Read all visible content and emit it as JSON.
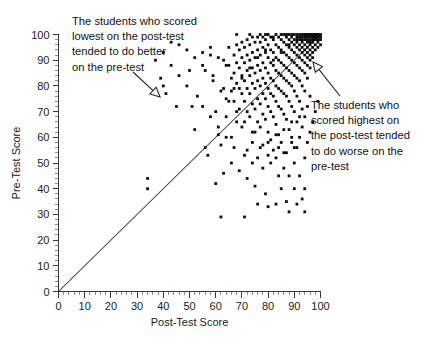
{
  "chart_data": {
    "type": "scatter",
    "title": "",
    "xlabel": "Post-Test Score",
    "ylabel": "Pre-Test Score",
    "xlim": [
      0,
      100
    ],
    "ylim": [
      0,
      100
    ],
    "xticks": [
      0,
      10,
      20,
      30,
      40,
      50,
      60,
      70,
      80,
      90,
      100
    ],
    "yticks": [
      0,
      10,
      20,
      30,
      40,
      50,
      60,
      70,
      80,
      90,
      100
    ],
    "minor_tick_step": 2,
    "grid": false,
    "legend": "none",
    "point_color": "#0d0d0d",
    "point_size_px": 2.1,
    "reference_line": {
      "name": "y = x identity line",
      "from": [
        0,
        0
      ],
      "to": [
        100,
        100
      ],
      "color": "#333333"
    },
    "annotations": [
      {
        "id": "low-post-test-note",
        "text_lines": [
          "The students who scored",
          "lowest on the post-test",
          "tended to do better",
          "on the pre-test"
        ],
        "text_anchor_px": [
          72,
          14
        ],
        "arrow_from_px": [
          133,
          72
        ],
        "arrow_to_px": [
          160,
          97
        ],
        "arrow_head": "hollow-triangle"
      },
      {
        "id": "high-post-test-note",
        "text_lines": [
          "The students who",
          "scored highest on",
          "the post-test tended",
          "to do worse on the",
          "pre-test"
        ],
        "text_anchor_px": [
          311,
          98
        ],
        "arrow_from_px": [
          340,
          96
        ],
        "arrow_to_px": [
          313,
          62
        ],
        "arrow_head": "hollow-triangle"
      }
    ],
    "points": [
      [
        34,
        44
      ],
      [
        34,
        40
      ],
      [
        62,
        29
      ],
      [
        71,
        29
      ],
      [
        39,
        83
      ],
      [
        40,
        80
      ],
      [
        41,
        77
      ],
      [
        45,
        72
      ],
      [
        50,
        86
      ],
      [
        51,
        72
      ],
      [
        55,
        88
      ],
      [
        52,
        63
      ],
      [
        56,
        56
      ],
      [
        58,
        92
      ],
      [
        59,
        84
      ],
      [
        60,
        70
      ],
      [
        57,
        53
      ],
      [
        61,
        61
      ],
      [
        62,
        57
      ],
      [
        63,
        90
      ],
      [
        63,
        79
      ],
      [
        64,
        75
      ],
      [
        64,
        68
      ],
      [
        65,
        95
      ],
      [
        65,
        88
      ],
      [
        66,
        83
      ],
      [
        66,
        78
      ],
      [
        66,
        60
      ],
      [
        67,
        92
      ],
      [
        67,
        85
      ],
      [
        67,
        74
      ],
      [
        68,
        96
      ],
      [
        68,
        89
      ],
      [
        68,
        81
      ],
      [
        68,
        66
      ],
      [
        69,
        94
      ],
      [
        69,
        87
      ],
      [
        69,
        79
      ],
      [
        69,
        71
      ],
      [
        70,
        97
      ],
      [
        70,
        91
      ],
      [
        70,
        84
      ],
      [
        70,
        77
      ],
      [
        70,
        64
      ],
      [
        71,
        95
      ],
      [
        71,
        89
      ],
      [
        71,
        82
      ],
      [
        71,
        74
      ],
      [
        72,
        98
      ],
      [
        72,
        92
      ],
      [
        72,
        86
      ],
      [
        72,
        79
      ],
      [
        72,
        70
      ],
      [
        72,
        55
      ],
      [
        73,
        96
      ],
      [
        73,
        90
      ],
      [
        73,
        84
      ],
      [
        73,
        77
      ],
      [
        73,
        68
      ],
      [
        74,
        99
      ],
      [
        74,
        93
      ],
      [
        74,
        87
      ],
      [
        74,
        81
      ],
      [
        74,
        73
      ],
      [
        74,
        58
      ],
      [
        75,
        97
      ],
      [
        75,
        91
      ],
      [
        75,
        85
      ],
      [
        75,
        79
      ],
      [
        75,
        71
      ],
      [
        75,
        62
      ],
      [
        76,
        99
      ],
      [
        76,
        94
      ],
      [
        76,
        88
      ],
      [
        76,
        82
      ],
      [
        76,
        75
      ],
      [
        76,
        66
      ],
      [
        76,
        52
      ],
      [
        77,
        97
      ],
      [
        77,
        92
      ],
      [
        77,
        86
      ],
      [
        77,
        80
      ],
      [
        77,
        73
      ],
      [
        77,
        64
      ],
      [
        78,
        99
      ],
      [
        78,
        95
      ],
      [
        78,
        89
      ],
      [
        78,
        83
      ],
      [
        78,
        77
      ],
      [
        78,
        69
      ],
      [
        78,
        57
      ],
      [
        79,
        98
      ],
      [
        79,
        93
      ],
      [
        79,
        87
      ],
      [
        79,
        81
      ],
      [
        79,
        75
      ],
      [
        79,
        67
      ],
      [
        80,
        100
      ],
      [
        80,
        96
      ],
      [
        80,
        91
      ],
      [
        80,
        85
      ],
      [
        80,
        79
      ],
      [
        80,
        72
      ],
      [
        80,
        62
      ],
      [
        80,
        53
      ],
      [
        81,
        99
      ],
      [
        81,
        94
      ],
      [
        81,
        89
      ],
      [
        81,
        83
      ],
      [
        81,
        77
      ],
      [
        81,
        70
      ],
      [
        81,
        59
      ],
      [
        82,
        98
      ],
      [
        82,
        93
      ],
      [
        82,
        88
      ],
      [
        82,
        82
      ],
      [
        82,
        76
      ],
      [
        82,
        68
      ],
      [
        82,
        55
      ],
      [
        83,
        100
      ],
      [
        83,
        96
      ],
      [
        83,
        91
      ],
      [
        83,
        86
      ],
      [
        83,
        80
      ],
      [
        83,
        74
      ],
      [
        83,
        65
      ],
      [
        84,
        99
      ],
      [
        84,
        95
      ],
      [
        84,
        90
      ],
      [
        84,
        85
      ],
      [
        84,
        79
      ],
      [
        84,
        72
      ],
      [
        84,
        61
      ],
      [
        85,
        98
      ],
      [
        85,
        94
      ],
      [
        85,
        89
      ],
      [
        85,
        84
      ],
      [
        85,
        78
      ],
      [
        85,
        71
      ],
      [
        85,
        58
      ],
      [
        86,
        100
      ],
      [
        86,
        97
      ],
      [
        86,
        93
      ],
      [
        86,
        88
      ],
      [
        86,
        83
      ],
      [
        86,
        77
      ],
      [
        86,
        69
      ],
      [
        86,
        54
      ],
      [
        87,
        99
      ],
      [
        87,
        96
      ],
      [
        87,
        92
      ],
      [
        87,
        87
      ],
      [
        87,
        82
      ],
      [
        87,
        76
      ],
      [
        87,
        67
      ],
      [
        88,
        100
      ],
      [
        88,
        98
      ],
      [
        88,
        95
      ],
      [
        88,
        91
      ],
      [
        88,
        86
      ],
      [
        88,
        81
      ],
      [
        88,
        74
      ],
      [
        88,
        63
      ],
      [
        89,
        99
      ],
      [
        89,
        97
      ],
      [
        89,
        94
      ],
      [
        89,
        90
      ],
      [
        89,
        85
      ],
      [
        89,
        80
      ],
      [
        89,
        72
      ],
      [
        89,
        60
      ],
      [
        90,
        100
      ],
      [
        90,
        98
      ],
      [
        90,
        96
      ],
      [
        90,
        93
      ],
      [
        90,
        89
      ],
      [
        90,
        84
      ],
      [
        90,
        78
      ],
      [
        90,
        70
      ],
      [
        90,
        56
      ],
      [
        91,
        100
      ],
      [
        91,
        99
      ],
      [
        91,
        97
      ],
      [
        91,
        95
      ],
      [
        91,
        92
      ],
      [
        91,
        88
      ],
      [
        91,
        83
      ],
      [
        91,
        76
      ],
      [
        91,
        66
      ],
      [
        92,
        100
      ],
      [
        92,
        99
      ],
      [
        92,
        98
      ],
      [
        92,
        96
      ],
      [
        92,
        94
      ],
      [
        92,
        91
      ],
      [
        92,
        87
      ],
      [
        92,
        82
      ],
      [
        92,
        74
      ],
      [
        93,
        100
      ],
      [
        93,
        99
      ],
      [
        93,
        98
      ],
      [
        93,
        97
      ],
      [
        93,
        95
      ],
      [
        93,
        93
      ],
      [
        93,
        90
      ],
      [
        93,
        86
      ],
      [
        93,
        80
      ],
      [
        93,
        71
      ],
      [
        94,
        100
      ],
      [
        94,
        100
      ],
      [
        94,
        99
      ],
      [
        94,
        98
      ],
      [
        94,
        96
      ],
      [
        94,
        94
      ],
      [
        94,
        92
      ],
      [
        94,
        89
      ],
      [
        94,
        85
      ],
      [
        94,
        78
      ],
      [
        95,
        100
      ],
      [
        95,
        100
      ],
      [
        95,
        99
      ],
      [
        95,
        98
      ],
      [
        95,
        97
      ],
      [
        95,
        95
      ],
      [
        95,
        93
      ],
      [
        95,
        91
      ],
      [
        95,
        88
      ],
      [
        95,
        83
      ],
      [
        96,
        100
      ],
      [
        96,
        100
      ],
      [
        96,
        99
      ],
      [
        96,
        98
      ],
      [
        96,
        97
      ],
      [
        96,
        96
      ],
      [
        96,
        94
      ],
      [
        96,
        92
      ],
      [
        96,
        90
      ],
      [
        96,
        87
      ],
      [
        97,
        100
      ],
      [
        97,
        100
      ],
      [
        97,
        99
      ],
      [
        97,
        99
      ],
      [
        97,
        98
      ],
      [
        97,
        97
      ],
      [
        97,
        95
      ],
      [
        97,
        93
      ],
      [
        97,
        91
      ],
      [
        98,
        100
      ],
      [
        98,
        100
      ],
      [
        98,
        99
      ],
      [
        98,
        99
      ],
      [
        98,
        98
      ],
      [
        98,
        96
      ],
      [
        98,
        94
      ],
      [
        99,
        100
      ],
      [
        99,
        100
      ],
      [
        99,
        99
      ],
      [
        99,
        98
      ],
      [
        99,
        97
      ],
      [
        99,
        95
      ],
      [
        100,
        100
      ],
      [
        100,
        99
      ],
      [
        100,
        98
      ],
      [
        100,
        96
      ],
      [
        85,
        100
      ],
      [
        87,
        100
      ],
      [
        89,
        100
      ],
      [
        82,
        99
      ],
      [
        79,
        100
      ],
      [
        77,
        100
      ],
      [
        73,
        100
      ],
      [
        68,
        100
      ],
      [
        84,
        45
      ],
      [
        88,
        45
      ],
      [
        92,
        45
      ],
      [
        85,
        40
      ],
      [
        90,
        40
      ],
      [
        94,
        40
      ],
      [
        87,
        35
      ],
      [
        83,
        34
      ],
      [
        79,
        38
      ],
      [
        75,
        41
      ],
      [
        72,
        44
      ],
      [
        69,
        47
      ],
      [
        66,
        50
      ],
      [
        63,
        46
      ],
      [
        60,
        42
      ],
      [
        76,
        34
      ],
      [
        80,
        33
      ],
      [
        88,
        31
      ],
      [
        91,
        34
      ],
      [
        94,
        31
      ],
      [
        93,
        36
      ],
      [
        86,
        48
      ],
      [
        90,
        50
      ],
      [
        83,
        52
      ],
      [
        87,
        54
      ],
      [
        91,
        56
      ],
      [
        94,
        52
      ],
      [
        89,
        58
      ],
      [
        92,
        60
      ],
      [
        95,
        58
      ],
      [
        84,
        56
      ],
      [
        81,
        50
      ],
      [
        78,
        48
      ],
      [
        74,
        50
      ],
      [
        71,
        53
      ],
      [
        67,
        56
      ],
      [
        64,
        60
      ],
      [
        61,
        64
      ],
      [
        58,
        68
      ],
      [
        55,
        72
      ],
      [
        53,
        76
      ],
      [
        49,
        80
      ],
      [
        46,
        84
      ],
      [
        43,
        88
      ],
      [
        96,
        62
      ],
      [
        93,
        64
      ],
      [
        97,
        66
      ],
      [
        94,
        68
      ],
      [
        98,
        70
      ],
      [
        95,
        72
      ],
      [
        99,
        74
      ],
      [
        96,
        76
      ],
      [
        92,
        68
      ],
      [
        89,
        66
      ],
      [
        86,
        63
      ],
      [
        83,
        61
      ],
      [
        80,
        58
      ],
      [
        77,
        56
      ],
      [
        74,
        62
      ],
      [
        71,
        66
      ],
      [
        68,
        70
      ],
      [
        65,
        74
      ],
      [
        62,
        78
      ],
      [
        59,
        82
      ],
      [
        56,
        86
      ],
      [
        67,
        79
      ],
      [
        70,
        83
      ],
      [
        73,
        87
      ],
      [
        76,
        91
      ],
      [
        79,
        94
      ],
      [
        82,
        90
      ],
      [
        85,
        93
      ],
      [
        88,
        96
      ],
      [
        91,
        98
      ],
      [
        64,
        88
      ],
      [
        61,
        91
      ],
      [
        58,
        95
      ],
      [
        55,
        93
      ],
      [
        52,
        91
      ],
      [
        49,
        94
      ],
      [
        46,
        96
      ],
      [
        43,
        97
      ],
      [
        40,
        93
      ],
      [
        37,
        90
      ]
    ],
    "notes": {
      "n_points_approx": 330,
      "shape": "dense cluster in upper-right, points mostly above identity line at low post-test scores and below it at high post-test scores"
    }
  }
}
